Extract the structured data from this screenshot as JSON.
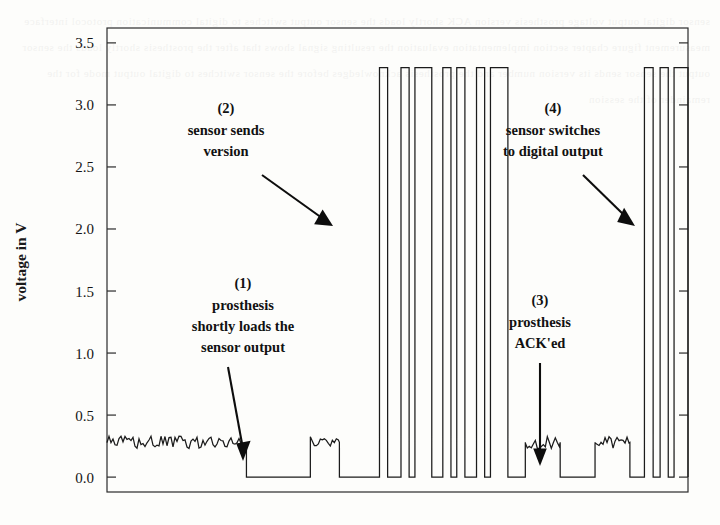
{
  "figure": {
    "kind": "oscilloscope-trace",
    "background_color": "#fdfdfb",
    "ink_color": "#1b1b1b"
  },
  "axis": {
    "ylabel": "voltage in V",
    "yticks": [
      "0.0",
      "0.5",
      "1.0",
      "1.5",
      "2.0",
      "2.5",
      "3.0",
      "3.5"
    ],
    "ytick_values": [
      0.0,
      0.5,
      1.0,
      1.5,
      2.0,
      2.5,
      3.0,
      3.5
    ],
    "xticks": [],
    "xlabel": ""
  },
  "annotations": [
    {
      "number": "(1)",
      "lines": [
        "prosthesis",
        "shortly loads the",
        "sensor output"
      ],
      "arrow": "diagonal-down-right"
    },
    {
      "number": "(2)",
      "lines": [
        "sensor sends",
        "version"
      ],
      "arrow": "diagonal-down-right"
    },
    {
      "number": "(3)",
      "lines": [
        "prosthesis",
        "ACK'ed"
      ],
      "arrow": "straight-down"
    },
    {
      "number": "(4)",
      "lines": [
        "sensor switches",
        "to digital output"
      ],
      "arrow": "diagonal-down-right"
    }
  ],
  "chart_data": {
    "type": "line",
    "title": "",
    "xlabel": "",
    "ylabel": "voltage in V",
    "ylim": [
      -0.12,
      3.62
    ],
    "xlim": [
      0,
      100
    ],
    "grid": false,
    "legend": null,
    "series": [
      {
        "name": "sensor output voltage",
        "units": "V",
        "idle_level": 0.28,
        "low_level": 0.0,
        "high_level": 3.3,
        "noise_amplitude": 0.05,
        "segments": [
          {
            "type": "noisy",
            "x0": 0.0,
            "x1": 24.0,
            "level": 0.28
          },
          {
            "type": "flat",
            "x0": 24.0,
            "x1": 35.0,
            "level": 0.0
          },
          {
            "type": "noisy",
            "x0": 35.0,
            "x1": 40.0,
            "level": 0.28
          },
          {
            "type": "flat",
            "x0": 40.0,
            "x1": 46.5,
            "level": 0.0
          },
          {
            "type": "pulse",
            "x0": 46.9,
            "x1": 48.3,
            "level": 3.3
          },
          {
            "type": "flat",
            "x0": 48.3,
            "x1": 50.6,
            "level": 0.0
          },
          {
            "type": "pulse",
            "x0": 50.6,
            "x1": 52.0,
            "level": 3.3
          },
          {
            "type": "pulse",
            "x0": 53.0,
            "x1": 55.9,
            "level": 3.3
          },
          {
            "type": "flat",
            "x0": 55.9,
            "x1": 57.8,
            "level": 0.0
          },
          {
            "type": "pulse",
            "x0": 57.8,
            "x1": 59.2,
            "level": 3.3
          },
          {
            "type": "pulse",
            "x0": 60.2,
            "x1": 61.6,
            "level": 3.3
          },
          {
            "type": "flat",
            "x0": 61.6,
            "x1": 63.6,
            "level": 0.0
          },
          {
            "type": "pulse",
            "x0": 63.6,
            "x1": 65.0,
            "level": 3.3
          },
          {
            "type": "pulse",
            "x0": 66.0,
            "x1": 69.0,
            "level": 3.3
          },
          {
            "type": "flat",
            "x0": 69.0,
            "x1": 72.0,
            "level": 0.0
          },
          {
            "type": "noisy",
            "x0": 72.0,
            "x1": 78.0,
            "level": 0.28
          },
          {
            "type": "flat",
            "x0": 78.0,
            "x1": 84.0,
            "level": 0.0
          },
          {
            "type": "noisy",
            "x0": 84.0,
            "x1": 90.0,
            "level": 0.28
          },
          {
            "type": "flat",
            "x0": 90.0,
            "x1": 92.5,
            "level": 0.0
          },
          {
            "type": "pulse",
            "x0": 92.5,
            "x1": 94.0,
            "level": 3.3
          },
          {
            "type": "pulse",
            "x0": 95.2,
            "x1": 96.6,
            "level": 3.3
          },
          {
            "type": "pulse",
            "x0": 97.6,
            "x1": 100.0,
            "level": 3.3
          }
        ]
      }
    ]
  },
  "bleed_text": "sensor digital output voltage prosthesis version ACK shortly loads the sensor output switches to digital communication protocol interface measurement figure chapter section implementation evaluation the resulting signal shows that after the prosthesis shortly loads the sensor output the sensor sends its version number and the prosthesis acknowledges before the sensor switches to digital output mode for the remainder of the session"
}
